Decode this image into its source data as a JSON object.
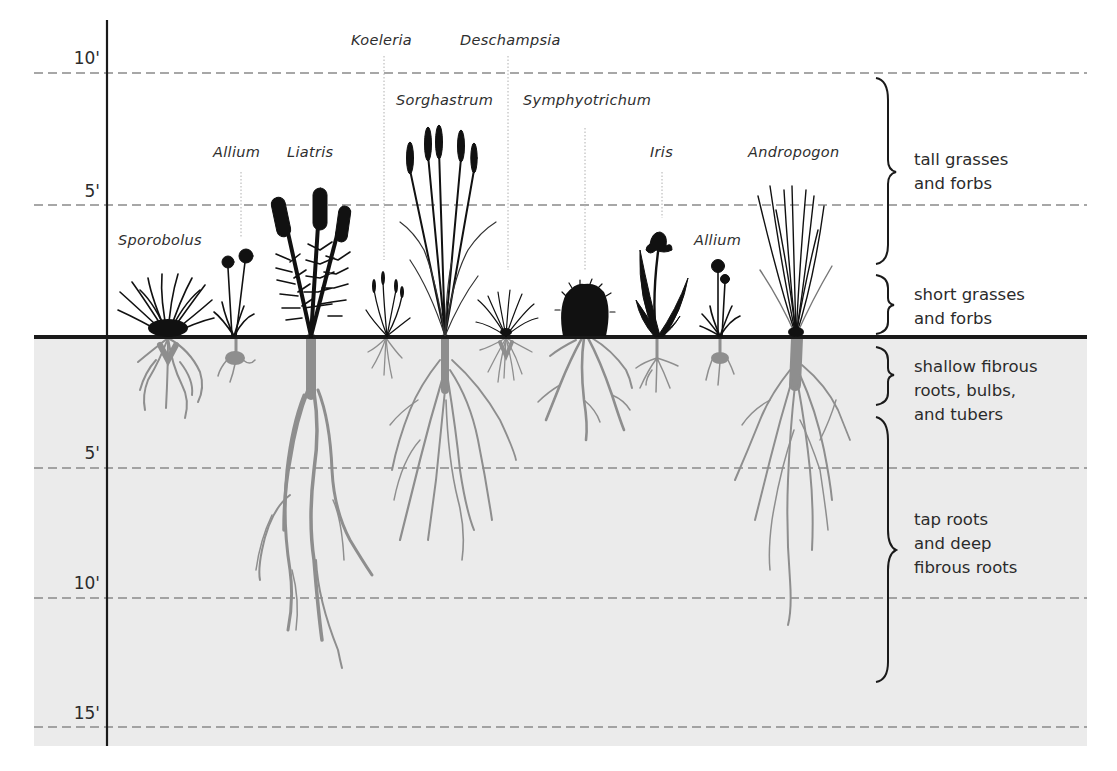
{
  "diagram": {
    "type": "prairie-root-depth-illustration",
    "colors": {
      "soil": "#ebebeb",
      "ground_line": "#1a1a1a",
      "plant_silhouette": "#111111",
      "roots": "#8e8e8e",
      "dashed_grid": "#8a8a8a",
      "text": "#2b2b2b"
    },
    "above_ground_scale": [
      {
        "label": "10'",
        "feet": 10
      },
      {
        "label": "5'",
        "feet": 5
      }
    ],
    "below_ground_scale": [
      {
        "label": "5'",
        "feet": 5
      },
      {
        "label": "10'",
        "feet": 10
      },
      {
        "label": "15'",
        "feet": 15
      }
    ],
    "plants": [
      {
        "name": "Sporobolus"
      },
      {
        "name": "Allium"
      },
      {
        "name": "Liatris"
      },
      {
        "name": "Koeleria"
      },
      {
        "name": "Sorghastrum"
      },
      {
        "name": "Deschampsia"
      },
      {
        "name": "Symphyotrichum"
      },
      {
        "name": "Iris"
      },
      {
        "name": "Allium"
      },
      {
        "name": "Andropogon"
      }
    ],
    "zones": [
      {
        "label": "tall grasses\nand forbs"
      },
      {
        "label": "short grasses\nand forbs"
      },
      {
        "label": "shallow fibrous\nroots, bulbs,\nand tubers"
      },
      {
        "label": "tap roots\nand deep\nfibrous roots"
      }
    ]
  }
}
